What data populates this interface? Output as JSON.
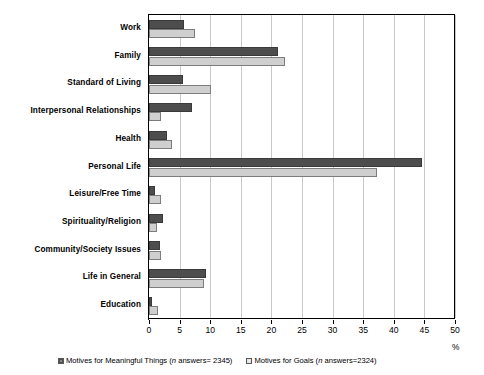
{
  "chart_data": {
    "type": "bar",
    "orientation": "horizontal",
    "title": "",
    "xlabel": "%",
    "ylabel": "",
    "xlim": [
      0,
      50
    ],
    "xticks": [
      0,
      5,
      10,
      15,
      20,
      25,
      30,
      35,
      40,
      45,
      50
    ],
    "grid": true,
    "legend_position": "bottom",
    "categories": [
      "Work",
      "Family",
      "Standard of Living",
      "Interpersonal Relationships",
      "Health",
      "Personal Life",
      "Leisure/Free Time",
      "Spirituality/Religion",
      "Community/Society Issues",
      "Life in General",
      "Education"
    ],
    "series": [
      {
        "name": "Motives for Meaningful Things",
        "n_label": "(n answers= 2345)",
        "color": "#4d4d4d",
        "values": [
          5.7,
          21.0,
          5.6,
          7.0,
          3.0,
          44.6,
          1.0,
          2.3,
          1.8,
          9.3,
          0.5
        ]
      },
      {
        "name": "Motives for Goals",
        "n_label": "(n answers=2324)",
        "color": "#cfcfcf",
        "values": [
          7.5,
          22.3,
          10.1,
          2.0,
          3.8,
          37.2,
          2.0,
          1.3,
          2.0,
          9.0,
          1.4
        ]
      }
    ]
  },
  "legend": {
    "items": [
      {
        "prefix": "Motives for Meaningful Things (",
        "italic": "n",
        "suffix": " answers= 2345)",
        "swatch": "dark"
      },
      {
        "prefix": "Motives for Goals (",
        "italic": "n",
        "suffix": " answers=2324)",
        "swatch": "light"
      }
    ]
  },
  "axis": {
    "unit_label": "%"
  }
}
